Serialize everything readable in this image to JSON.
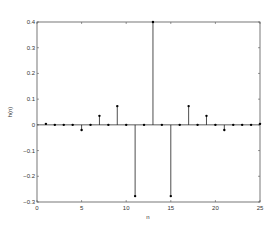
{
  "chart_data": {
    "type": "stem",
    "title": "",
    "xlabel": "n",
    "ylabel": "h(n)",
    "xlim": [
      0,
      25
    ],
    "ylim": [
      -0.3,
      0.4
    ],
    "xticks": [
      0,
      5,
      10,
      15,
      20,
      25
    ],
    "yticks": [
      -0.3,
      -0.2,
      -0.1,
      0,
      0.1,
      0.2,
      0.3,
      0.4
    ],
    "xtick_labels": [
      "0",
      "5",
      "10",
      "15",
      "20",
      "25"
    ],
    "ytick_labels": [
      "-0.3",
      "-0.2",
      "-0.1",
      "0",
      "0.1",
      "0.2",
      "0.3",
      "0.4"
    ],
    "grid": false,
    "x": [
      1,
      2,
      3,
      4,
      5,
      6,
      7,
      8,
      9,
      10,
      11,
      12,
      13,
      14,
      15,
      16,
      17,
      18,
      19,
      20,
      21,
      22,
      23,
      24,
      25
    ],
    "y": [
      0.004,
      0,
      0,
      0,
      -0.02,
      0,
      0.035,
      0,
      0.073,
      0,
      -0.277,
      0,
      0.4,
      0,
      -0.277,
      0,
      0.073,
      0,
      0.035,
      0,
      -0.02,
      0,
      0,
      0,
      0.004
    ],
    "color": "#000000"
  }
}
